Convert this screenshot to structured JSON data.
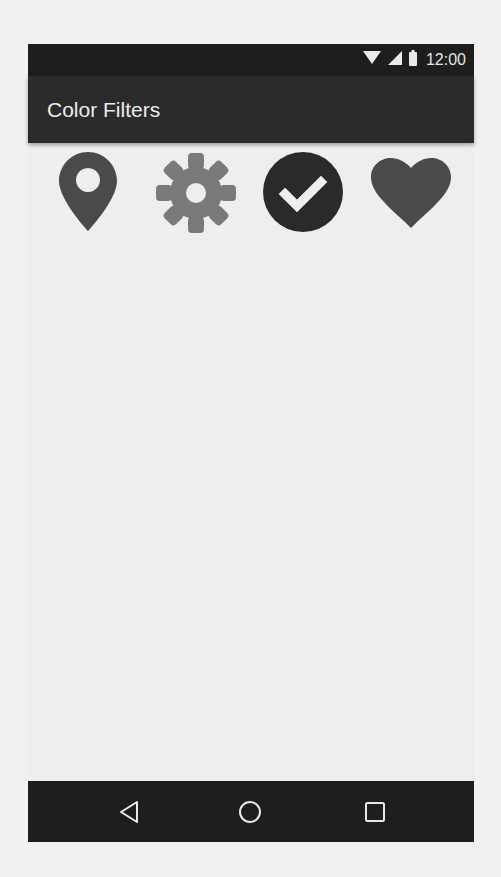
{
  "status_bar": {
    "time": "12:00",
    "icons": [
      "wifi-icon",
      "cellular-signal-icon",
      "battery-icon"
    ]
  },
  "toolbar": {
    "title": "Color Filters"
  },
  "icon_row": {
    "icons": [
      {
        "name": "location-pin-icon",
        "color": "#4a4a4a"
      },
      {
        "name": "gear-icon",
        "color": "#7a7a7a"
      },
      {
        "name": "check-circle-icon",
        "color": "#2a2a2a"
      },
      {
        "name": "heart-icon",
        "color": "#4a4a4a"
      }
    ]
  },
  "nav_bar": {
    "buttons": [
      "back",
      "home",
      "recents"
    ]
  },
  "colors": {
    "status_bar_bg": "#1e1e1e",
    "toolbar_bg": "#2b2b2b",
    "content_bg": "#eeeeee",
    "nav_bar_bg": "#1e1e1e"
  }
}
